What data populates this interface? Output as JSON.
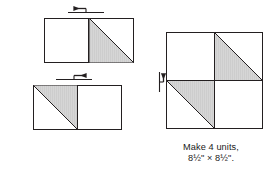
{
  "figure": {
    "name": "pinwheel-block-assembly",
    "type": "quilting-assembly-diagram",
    "background_color": "#ffffff",
    "ink_color": "#231f20",
    "shade_color": "#d3d3d3",
    "shade_edge_color": "#b9b9b9"
  },
  "caption": {
    "line1": "Make 4 units,",
    "line2": "8½\" × 8½\"."
  },
  "units": {
    "top_row": {
      "name": "top-pair",
      "left_square": {
        "name": "top-left-square",
        "fill": "plain",
        "shaded_half": "none",
        "diagonal": "none"
      },
      "right_square": {
        "name": "top-right-square",
        "fill": "half-square-triangle",
        "shaded_half": "below",
        "diagonal": "tl-br"
      },
      "seam_marker": {
        "name": "top-seam-arrow",
        "direction": "left",
        "label": "press seam left"
      }
    },
    "bottom_row": {
      "name": "bottom-pair",
      "left_square": {
        "name": "bottom-left-square",
        "fill": "half-square-triangle",
        "shaded_half": "above",
        "diagonal": "tl-br"
      },
      "right_square": {
        "name": "bottom-right-square",
        "fill": "plain",
        "shaded_half": "none",
        "diagonal": "none"
      },
      "seam_marker": {
        "name": "bottom-seam-arrow",
        "direction": "right",
        "label": "press seam right"
      }
    }
  },
  "assembled_block": {
    "name": "pinwheel-block",
    "rows": 2,
    "columns": 2,
    "quadrants": [
      {
        "name": "block-quadrant-top-left",
        "fill": "plain",
        "shaded_half": "none",
        "diagonal": "none"
      },
      {
        "name": "block-quadrant-top-right",
        "fill": "half-square-triangle",
        "shaded_half": "below",
        "diagonal": "tl-br"
      },
      {
        "name": "block-quadrant-bottom-left",
        "fill": "half-square-triangle",
        "shaded_half": "above",
        "diagonal": "tl-br"
      },
      {
        "name": "block-quadrant-bottom-right",
        "fill": "plain",
        "shaded_half": "none",
        "diagonal": "none"
      }
    ],
    "seam_marker": {
      "name": "block-seam-arrow",
      "direction": "up",
      "label": "press seam up"
    }
  }
}
